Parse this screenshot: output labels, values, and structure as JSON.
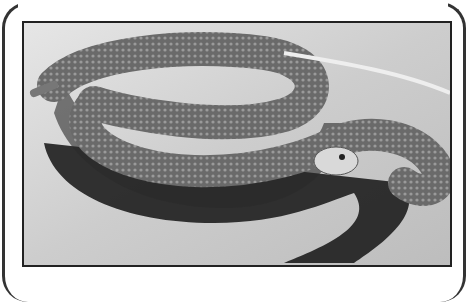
{
  "image": {
    "subject": "coiled rattlesnake on sand",
    "style": "grayscale photograph",
    "colors": {
      "sand": "#d6d6d6",
      "snake": "#5a5a5a",
      "shadow": "#1e1e1e",
      "border": "#222222"
    }
  }
}
